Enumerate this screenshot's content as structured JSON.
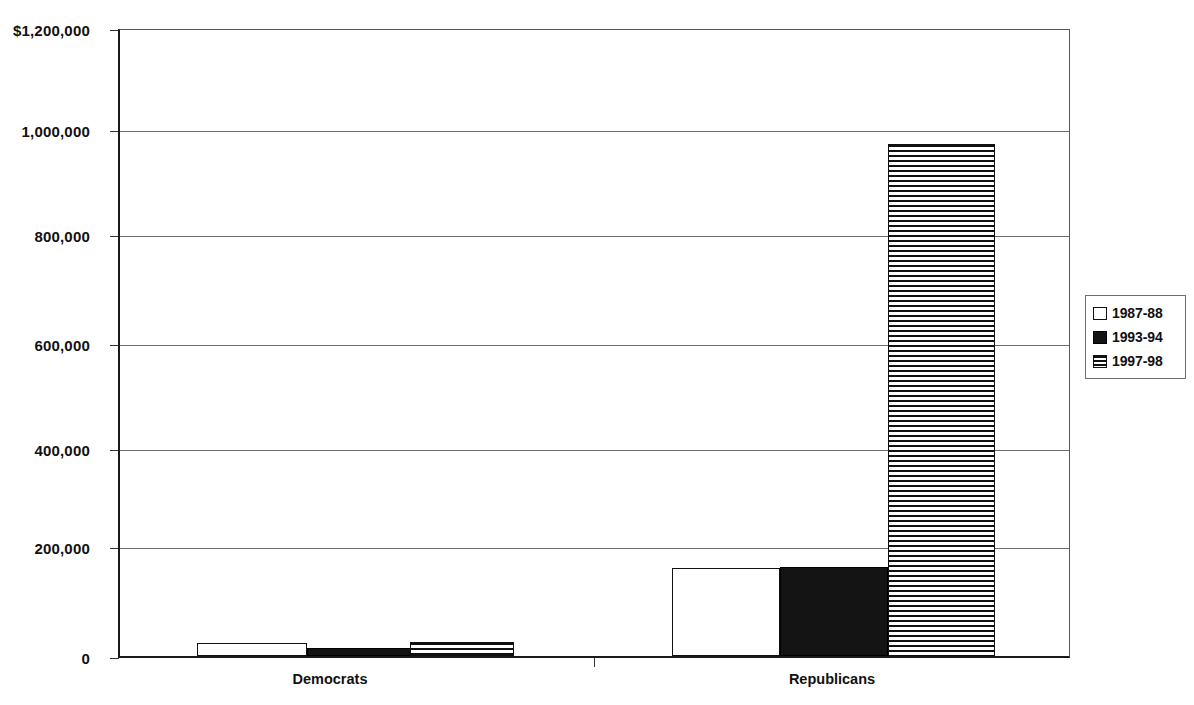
{
  "chart_data": {
    "type": "bar",
    "title": "",
    "xlabel": "",
    "ylabel": "",
    "categories": [
      "Democrats",
      "Republicans"
    ],
    "series": [
      {
        "name": "1987-88",
        "pattern": "white",
        "values": [
          24000,
          168000
        ]
      },
      {
        "name": "1993-94",
        "pattern": "black",
        "values": [
          15000,
          171000
        ]
      },
      {
        "name": "1997-98",
        "pattern": "striped",
        "values": [
          27000,
          981000
        ]
      }
    ],
    "ylim": [
      0,
      1200000
    ],
    "ytick_values": [
      0,
      200000,
      400000,
      600000,
      800000,
      1000000,
      1200000
    ],
    "ytick_labels": [
      "0",
      "200,000",
      "400,000",
      "600,000",
      "800,000",
      "1,000,000",
      "$1,200,000"
    ],
    "grid": true,
    "legend_position": "right",
    "legend_entries": [
      "1987-88",
      "1993-94",
      "1997-98"
    ],
    "colors": {
      "axis": "#1a1a1a",
      "gridline": "#6b6b6d",
      "bar_fill_black": "#141414",
      "bar_fill_white": "#ffffff",
      "text": "#111111",
      "background": "#ffffff"
    }
  }
}
